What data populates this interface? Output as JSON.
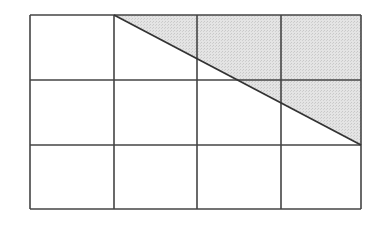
{
  "diagram": {
    "type": "grid-with-shaded-triangle",
    "grid": {
      "rows": 3,
      "cols": 4,
      "x0": 30,
      "y0": 15,
      "x1": 361,
      "y1": 209,
      "col_lines": [
        30,
        114,
        197,
        281,
        361
      ],
      "row_lines": [
        15,
        80,
        145,
        209
      ]
    },
    "diagonal": {
      "from": [
        114,
        15
      ],
      "to": [
        361,
        145
      ]
    },
    "shaded_region": {
      "points": [
        [
          114,
          15
        ],
        [
          361,
          15
        ],
        [
          361,
          145
        ]
      ]
    },
    "colors": {
      "line": "#444444",
      "shade": "#dcdcdc",
      "background": "#ffffff"
    }
  }
}
